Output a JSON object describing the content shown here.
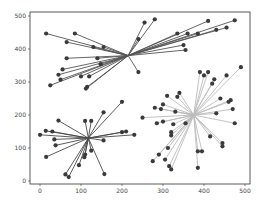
{
  "chart_data": {
    "type": "scatter",
    "title": "",
    "xlabel": "",
    "ylabel": "",
    "xlim": [
      -25,
      525
    ],
    "ylim": [
      -10,
      510
    ],
    "grid": false,
    "x_ticks": [
      0,
      100,
      200,
      300,
      400,
      500
    ],
    "y_ticks": [
      0,
      100,
      200,
      300,
      400,
      500
    ],
    "x_tick_labels": [
      "0",
      "100",
      "200",
      "300",
      "400",
      "500"
    ],
    "y_tick_labels": [
      "0",
      "100",
      "200",
      "300",
      "400",
      "500"
    ],
    "series": [
      {
        "name": "cluster-1",
        "color": "#555555",
        "center": [
          215,
          380
        ],
        "points": [
          [
            15,
            447
          ],
          [
            85,
            447
          ],
          [
            65,
            421
          ],
          [
            130,
            406
          ],
          [
            155,
            406
          ],
          [
            65,
            372
          ],
          [
            140,
            372
          ],
          [
            148,
            354
          ],
          [
            55,
            338
          ],
          [
            45,
            322
          ],
          [
            50,
            307
          ],
          [
            100,
            317
          ],
          [
            120,
            317
          ],
          [
            115,
            285
          ],
          [
            112,
            280
          ],
          [
            25,
            290
          ],
          [
            240,
            330
          ],
          [
            280,
            490
          ],
          [
            255,
            480
          ],
          [
            240,
            430
          ],
          [
            335,
            447
          ],
          [
            360,
            447
          ],
          [
            385,
            447
          ],
          [
            410,
            485
          ],
          [
            430,
            458
          ],
          [
            455,
            465
          ],
          [
            475,
            487
          ],
          [
            350,
            412
          ],
          [
            355,
            397
          ]
        ]
      },
      {
        "name": "cluster-2",
        "color": "#4a4a4a",
        "center": [
          118,
          130
        ],
        "points": [
          [
            0,
            140
          ],
          [
            14,
            152
          ],
          [
            45,
            183
          ],
          [
            30,
            150
          ],
          [
            35,
            126
          ],
          [
            38,
            108
          ],
          [
            15,
            73
          ],
          [
            110,
            182
          ],
          [
            125,
            182
          ],
          [
            155,
            208
          ],
          [
            200,
            240
          ],
          [
            200,
            148
          ],
          [
            210,
            150
          ],
          [
            155,
            123
          ],
          [
            125,
            92
          ],
          [
            110,
            80
          ],
          [
            108,
            72
          ],
          [
            95,
            48
          ],
          [
            62,
            20
          ],
          [
            70,
            12
          ],
          [
            157,
            21
          ],
          [
            230,
            140
          ]
        ]
      },
      {
        "name": "cluster-3",
        "color": "#bbbbbb",
        "center": [
          375,
          200
        ],
        "points": [
          [
            250,
            192
          ],
          [
            280,
            222
          ],
          [
            300,
            232
          ],
          [
            335,
            255
          ],
          [
            340,
            267
          ],
          [
            310,
            258
          ],
          [
            295,
            218
          ],
          [
            330,
            210
          ],
          [
            285,
            175
          ],
          [
            300,
            180
          ],
          [
            325,
            172
          ],
          [
            355,
            175
          ],
          [
            320,
            148
          ],
          [
            320,
            138
          ],
          [
            312,
            100
          ],
          [
            290,
            80
          ],
          [
            275,
            60
          ],
          [
            305,
            65
          ],
          [
            315,
            45
          ],
          [
            320,
            35
          ],
          [
            385,
            90
          ],
          [
            395,
            90
          ],
          [
            385,
            40
          ],
          [
            415,
            135
          ],
          [
            445,
            115
          ],
          [
            445,
            105
          ],
          [
            475,
            175
          ],
          [
            470,
            218
          ],
          [
            460,
            240
          ],
          [
            440,
            250
          ],
          [
            420,
            295
          ],
          [
            425,
            308
          ],
          [
            390,
            330
          ],
          [
            400,
            320
          ],
          [
            410,
            330
          ],
          [
            465,
            245
          ],
          [
            490,
            345
          ],
          [
            455,
            320
          ],
          [
            430,
            205
          ]
        ]
      }
    ]
  }
}
